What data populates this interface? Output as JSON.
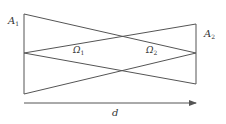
{
  "diagram": {
    "labels": {
      "a1": "A",
      "a1_sub": "1",
      "a2": "A",
      "a2_sub": "2",
      "omega1": "Ω",
      "omega1_sub": "1",
      "omega2": "Ω",
      "omega2_sub": "2",
      "distance": "d"
    },
    "colors": {
      "line": "#555555",
      "text": "#333333"
    }
  }
}
